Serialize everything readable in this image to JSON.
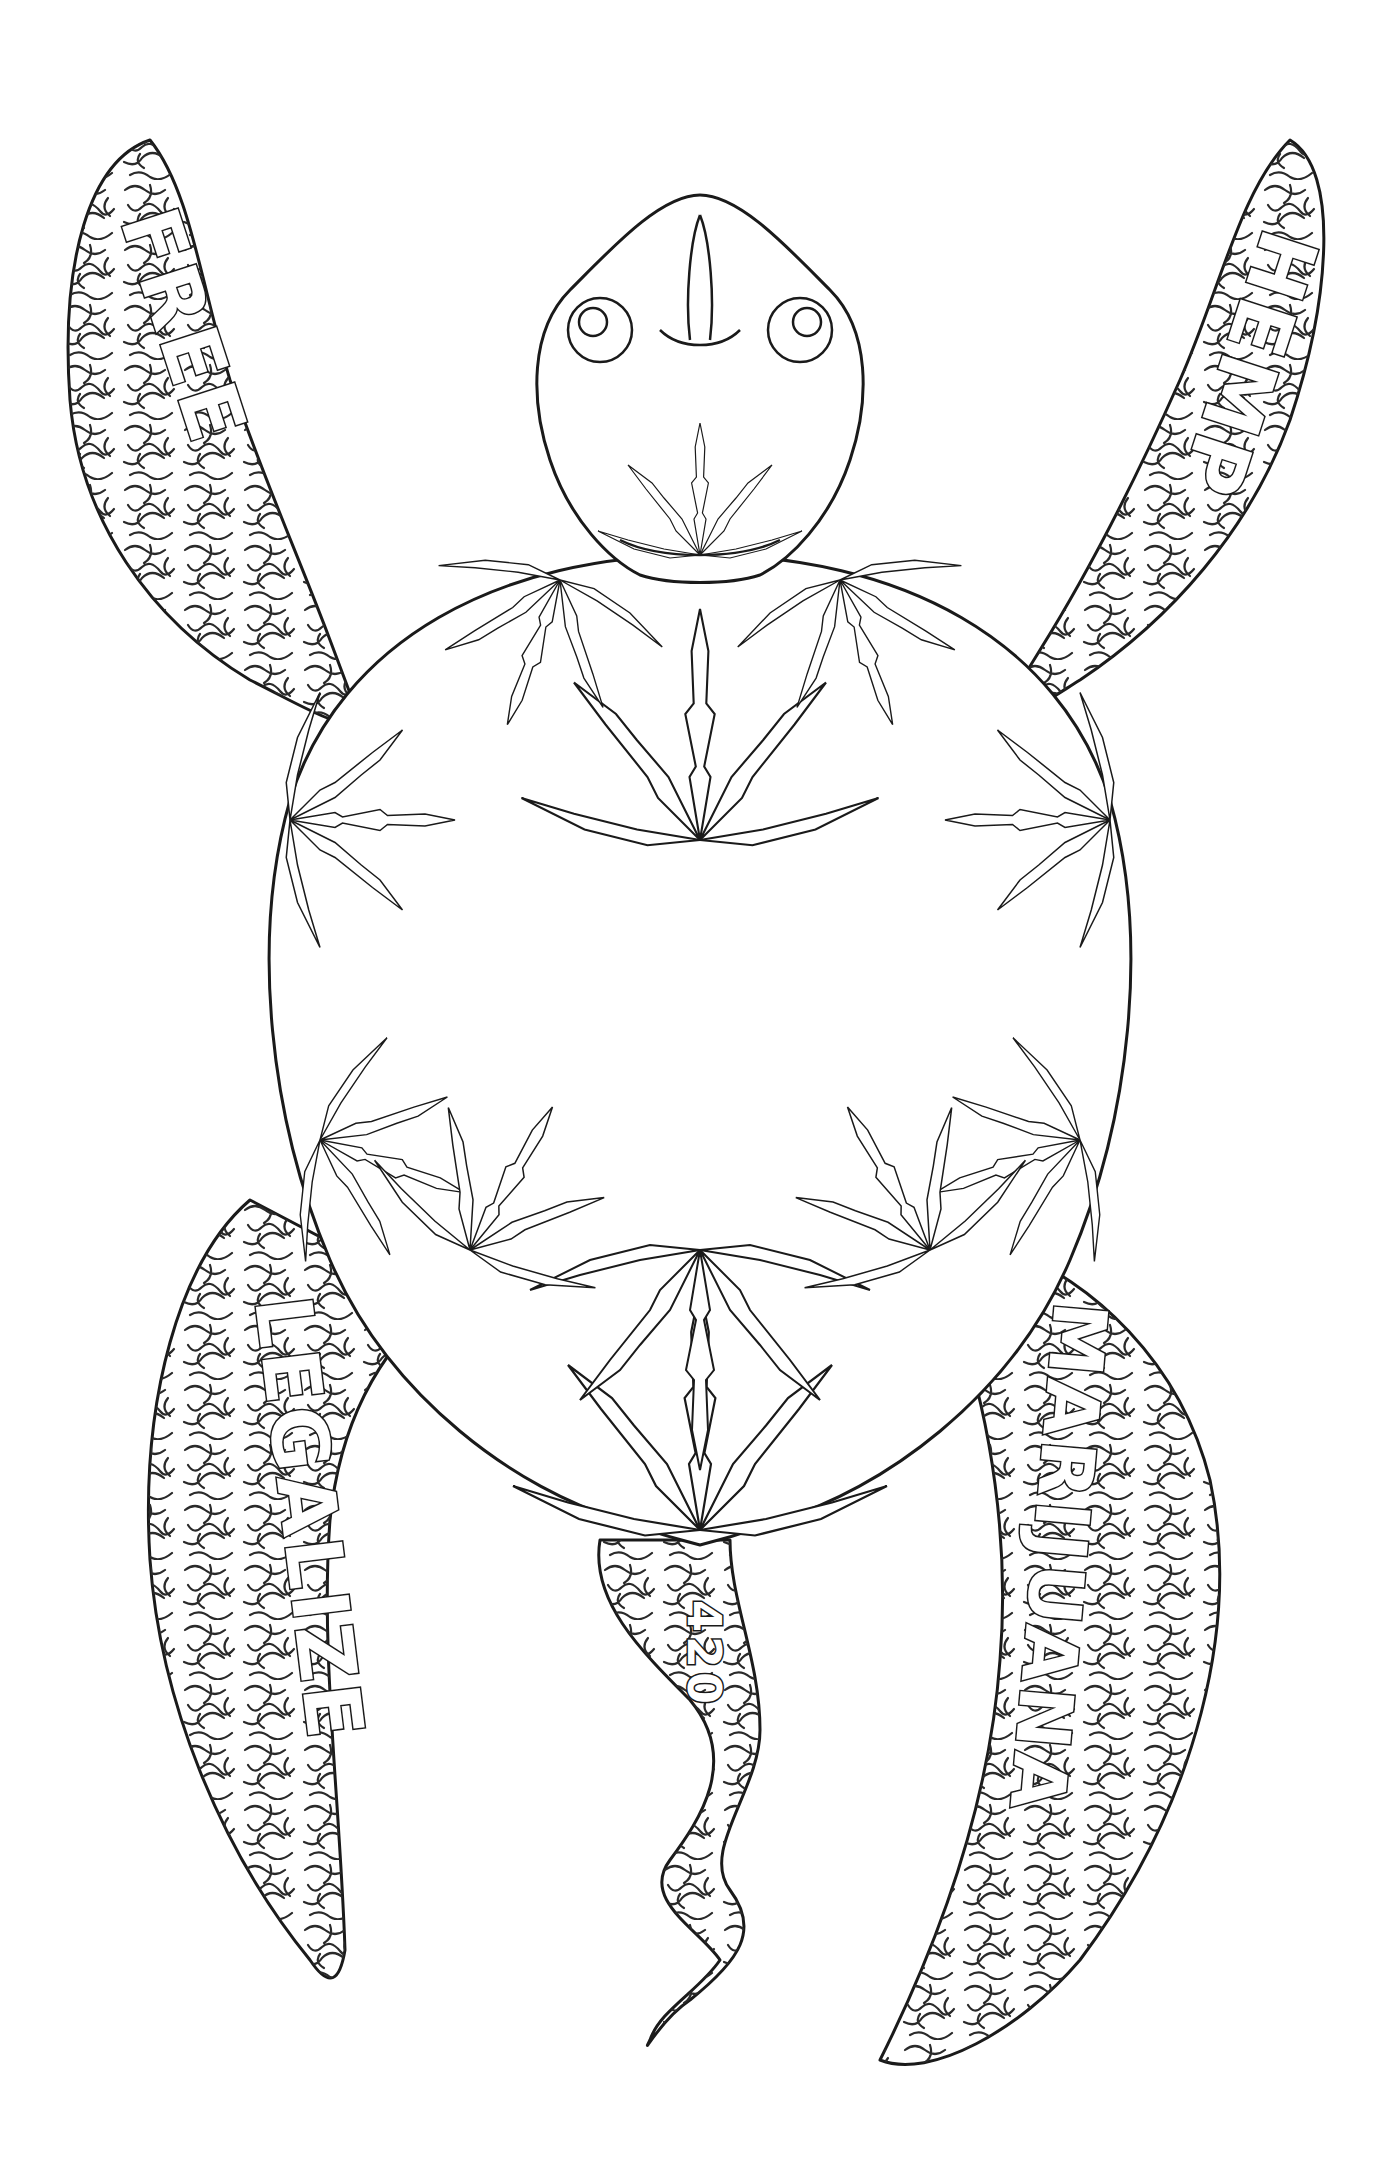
{
  "artwork": {
    "subject": "sea turtle line-art coloring page",
    "colors": {
      "background": "#ffffff",
      "ink": "#1a1a1a"
    },
    "flippers": {
      "top_left": {
        "text": "FREE"
      },
      "top_right": {
        "text": "HEMP"
      },
      "bottom_left": {
        "text": "LEGALIZE"
      },
      "bottom_right": {
        "text": "MARIJUANA"
      }
    },
    "tail": {
      "text": "420"
    },
    "shell": {
      "motif": "cannabis leaves"
    },
    "head": {
      "motif": "tribal pattern with cannabis leaf"
    }
  }
}
